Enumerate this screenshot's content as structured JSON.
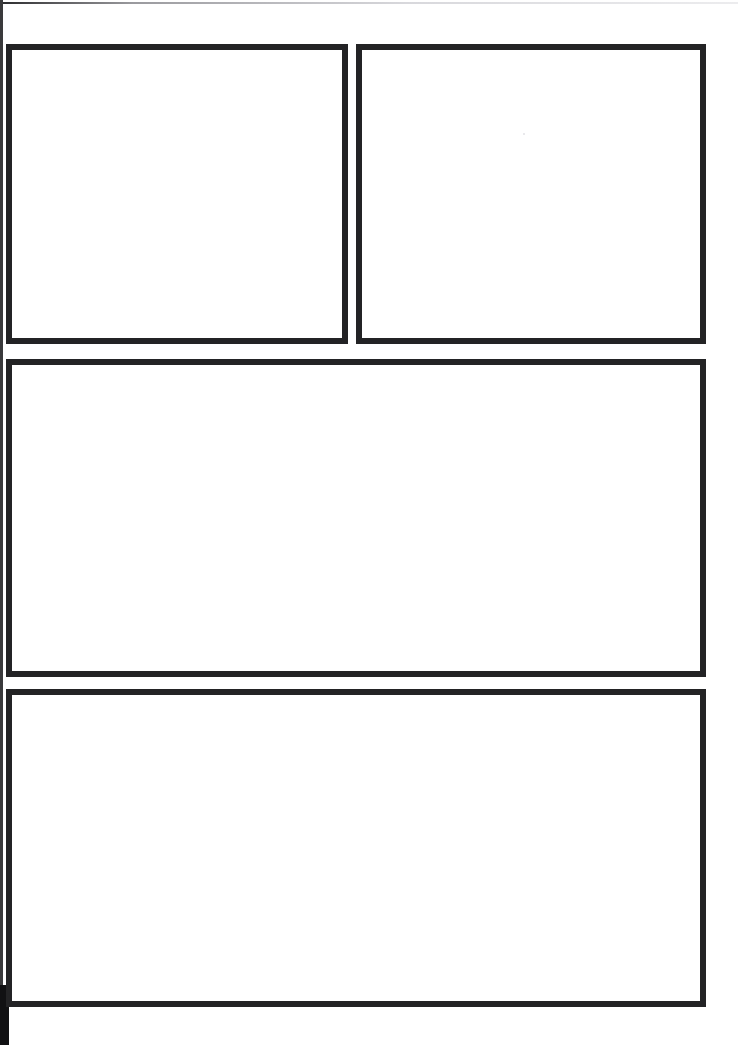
{
  "page": {
    "type": "scanned-document-page",
    "width": 738,
    "height": 1045,
    "background_color": "#ffffff",
    "border_color": "#232325",
    "gutter_color": "#111113",
    "visible_text": "",
    "note": "Blank scanned page: four empty bordered placeholder frames, no text or figures rendered."
  },
  "frames": [
    {
      "id": "frame-top-left",
      "label": "",
      "content": "",
      "position": "top-left",
      "x": 6,
      "y": 44,
      "width": 342,
      "height": 300
    },
    {
      "id": "frame-top-right",
      "label": "",
      "content": "",
      "position": "top-right",
      "x": 356,
      "y": 44,
      "width": 350,
      "height": 300
    },
    {
      "id": "frame-middle",
      "label": "",
      "content": "",
      "position": "middle-full-width",
      "x": 6,
      "y": 359,
      "width": 700,
      "height": 318
    },
    {
      "id": "frame-bottom",
      "label": "",
      "content": "",
      "position": "bottom-full-width",
      "x": 6,
      "y": 689,
      "width": 700,
      "height": 318
    }
  ],
  "artifacts": {
    "gutter_strip_label": "",
    "scan_edge_label": "",
    "speck_label": ""
  }
}
